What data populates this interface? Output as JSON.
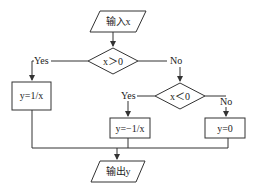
{
  "diagram": {
    "type": "flowchart",
    "nodes": {
      "input": {
        "label": "输入x",
        "shape": "parallelogram"
      },
      "cond1": {
        "label": "x＞0",
        "shape": "diamond"
      },
      "proc1": {
        "label": "y=1/x",
        "shape": "rectangle"
      },
      "cond2": {
        "label": "x＜0",
        "shape": "diamond"
      },
      "proc2": {
        "label": "y=−1/x",
        "shape": "rectangle"
      },
      "proc3": {
        "label": "y=0",
        "shape": "rectangle"
      },
      "output": {
        "label": "输出y",
        "shape": "parallelogram"
      }
    },
    "edges": {
      "cond1_yes": "Yes",
      "cond1_no": "No",
      "cond2_yes": "Yes",
      "cond2_no": "No"
    },
    "colors": {
      "line": "#333333",
      "text": "#222222",
      "background": "#ffffff"
    }
  }
}
